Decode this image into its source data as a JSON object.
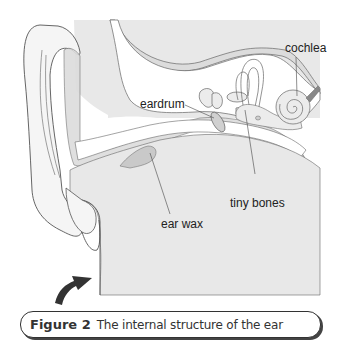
{
  "diagram": {
    "title": "The internal structure of the ear",
    "labels": {
      "cochlea": "cochlea",
      "eardrum": "eardrum",
      "tiny_bones": "tiny bones",
      "ear_wax": "ear wax"
    }
  },
  "caption": {
    "figure_number": "Figure 2",
    "text": "The internal structure of the ear"
  },
  "colors": {
    "tissue_fill": "#e6e6e6",
    "canal_fill": "#f7f7f7",
    "line": "#555555",
    "wax_fill": "#c9c9c9",
    "arrow": "#333333"
  }
}
